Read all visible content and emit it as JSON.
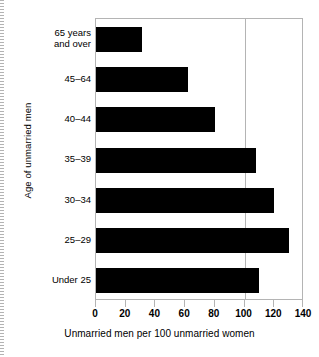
{
  "chart_data": {
    "type": "bar",
    "orientation": "horizontal",
    "title": "",
    "xlabel": "Unmarried men per 100 unmarried women",
    "ylabel": "Age of unmarried men",
    "categories": [
      "65 years\nand over",
      "45–64",
      "40–44",
      "35–39",
      "30–34",
      "25–29",
      "Under 25"
    ],
    "values": [
      31,
      62,
      80,
      108,
      120,
      130,
      110
    ],
    "xlim": [
      0,
      140
    ],
    "xticks": [
      0,
      20,
      40,
      60,
      80,
      100,
      120,
      140
    ],
    "xtick_labels": [
      "0",
      "20",
      "40",
      "60",
      "80",
      "100",
      "120",
      "140"
    ],
    "grid": true,
    "gridlines_x": [
      100
    ],
    "legend": "none",
    "bar_color": "#000000",
    "frame_color": "#b4b4b4",
    "background": "#ffffff"
  }
}
